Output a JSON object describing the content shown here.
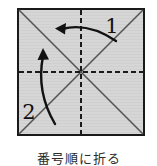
{
  "figure": {
    "caption": "番号順に折る",
    "colors": {
      "paper_fill": "#d6d6d6",
      "border": "#1a1a1a",
      "diagonal": "#4d4d4d",
      "dashed_line": "#1a1a1a",
      "arrow": "#111111",
      "background": "#ffffff",
      "caption_text": "#2b2b2b"
    },
    "paper": {
      "shape": "square",
      "left": 17,
      "top": 8,
      "size": 128,
      "border_width": 2,
      "center_x": 81,
      "center_y": 72
    },
    "fold_lines": [
      {
        "name": "diagonal-tl-br",
        "style": "solid",
        "from": [
          17,
          8
        ],
        "to": [
          145,
          136
        ]
      },
      {
        "name": "diagonal-tr-bl",
        "style": "solid",
        "from": [
          145,
          8
        ],
        "to": [
          17,
          136
        ]
      },
      {
        "name": "center-horizontal",
        "style": "dashed",
        "from": [
          17,
          72
        ],
        "to": [
          145,
          72
        ]
      },
      {
        "name": "center-vertical",
        "style": "dashed",
        "from": [
          81,
          8
        ],
        "to": [
          81,
          136
        ]
      }
    ],
    "dash_pattern": "5,3",
    "arrows": [
      {
        "name": "fold-arrow-1",
        "label": "1",
        "label_x": 112,
        "label_y": 24,
        "direction": "right-to-left",
        "head_at": [
          57,
          29
        ],
        "tail_at": [
          116,
          41
        ]
      },
      {
        "name": "fold-arrow-2",
        "label": "2",
        "label_x": 28,
        "label_y": 110,
        "direction": "bottom-to-top",
        "head_at": [
          43,
          49
        ],
        "tail_at": [
          55,
          124
        ]
      }
    ]
  }
}
